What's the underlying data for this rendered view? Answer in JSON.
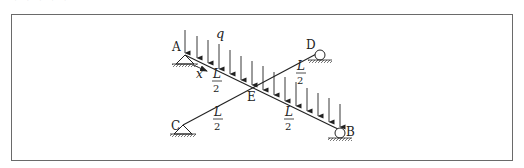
{
  "header": {
    "cut_text": "· · · · ·"
  },
  "diagram": {
    "points": {
      "A": {
        "label": "A",
        "x": 185,
        "y": 55
      },
      "B": {
        "label": "B",
        "x": 340,
        "y": 130
      },
      "C": {
        "label": "C",
        "x": 183,
        "y": 125
      },
      "D": {
        "label": "D",
        "x": 320,
        "y": 52
      },
      "E": {
        "label": "E",
        "x": 253,
        "y": 87
      }
    },
    "load": {
      "label": "q",
      "description": "uniformly distributed load acting downward on member A–B"
    },
    "axis": {
      "label": "x"
    },
    "segments": [
      {
        "name": "AE",
        "num": "L",
        "den": "2"
      },
      {
        "name": "ED",
        "num": "L",
        "den": "2"
      },
      {
        "name": "CE",
        "num": "L",
        "den": "2"
      },
      {
        "name": "EB",
        "num": "L",
        "den": "2"
      }
    ],
    "supports": {
      "A": "pin",
      "C": "pin",
      "B": "roller",
      "D": "roller"
    },
    "colors": {
      "line": "#222222",
      "frame": "#6a6a6a",
      "hatch": "#555555"
    }
  }
}
